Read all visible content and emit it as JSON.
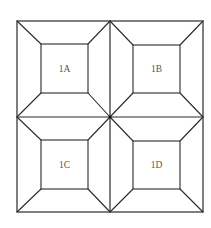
{
  "diagram": {
    "type": "quilt-block-frames",
    "outer": {
      "x1": 17,
      "y1": 21,
      "x2": 203,
      "y2": 212
    },
    "center": {
      "x": 110,
      "y": 117
    },
    "panels": [
      {
        "id": "1A",
        "label": "1A",
        "outer": {
          "x1": 17,
          "y1": 21,
          "x2": 110,
          "y2": 117
        },
        "inner": {
          "x1": 41,
          "y1": 44,
          "x2": 88,
          "y2": 93
        }
      },
      {
        "id": "1B",
        "label": "1B",
        "outer": {
          "x1": 110,
          "y1": 21,
          "x2": 203,
          "y2": 117
        },
        "inner": {
          "x1": 133,
          "y1": 45,
          "x2": 180,
          "y2": 93
        }
      },
      {
        "id": "1C",
        "label": "1C",
        "outer": {
          "x1": 17,
          "y1": 117,
          "x2": 110,
          "y2": 212
        },
        "inner": {
          "x1": 41,
          "y1": 140,
          "x2": 88,
          "y2": 189
        }
      },
      {
        "id": "1D",
        "label": "1D",
        "outer": {
          "x1": 110,
          "y1": 117,
          "x2": 203,
          "y2": 212
        },
        "inner": {
          "x1": 133,
          "y1": 141,
          "x2": 180,
          "y2": 189
        }
      }
    ],
    "colors": {
      "stroke": "#2a2a2a",
      "label": "#555555",
      "background": "#ffffff"
    }
  }
}
